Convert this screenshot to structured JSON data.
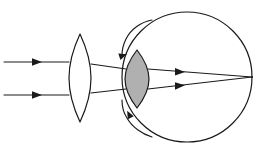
{
  "figure": {
    "type": "optical-ray-diagram",
    "canvas": {
      "width": 263,
      "height": 154,
      "background": "#ffffff"
    }
  },
  "colors": {
    "stroke": "#1a1a1a",
    "eye_lens_fill": "#b0b0b0",
    "background": "#ffffff",
    "shape_fill": "#ffffff"
  },
  "elements": {
    "corrective_lens": {
      "label": "corrective converging lens",
      "shape": "biconvex",
      "center_x": 80,
      "top_y": 34,
      "bottom_y": 122,
      "half_width": 11,
      "fill": "#ffffff"
    },
    "eyeball": {
      "label": "eyeball outline",
      "shape": "circle",
      "center_x": 187,
      "center_y": 77,
      "radius": 65,
      "fill": "#ffffff"
    },
    "cornea_arcs": {
      "label": "cornea arcs",
      "count": 2,
      "has_arrowheads": true
    },
    "eye_lens": {
      "label": "crystalline lens of the eye",
      "shape": "biconvex",
      "center_x": 137,
      "top_y": 50,
      "bottom_y": 108,
      "half_width": 12,
      "fill": "#b0b0b0"
    },
    "focal_point": {
      "label": "retina focal point",
      "x": 252,
      "y": 77
    }
  },
  "chart_data": {
    "type": "scatter",
    "xlabel": "",
    "ylabel": "",
    "xlim": [
      0,
      263
    ],
    "ylim": [
      0,
      154
    ],
    "grid": false,
    "legend": "none",
    "series": [
      {
        "name": "upper incoming parallel ray",
        "points": [
          [
            4,
            62
          ],
          [
            69,
            62
          ]
        ],
        "arrow_at": [
          38,
          62
        ],
        "arrow_direction": "right"
      },
      {
        "name": "lower incoming parallel ray",
        "points": [
          [
            4,
            95
          ],
          [
            69,
            95
          ]
        ],
        "arrow_at": [
          38,
          95
        ],
        "arrow_direction": "right"
      },
      {
        "name": "upper refracted ray after corrective lens",
        "points": [
          [
            91,
            64
          ],
          [
            126,
            69
          ]
        ],
        "arrow_at": null,
        "arrow_direction": "right"
      },
      {
        "name": "lower refracted ray after corrective lens",
        "points": [
          [
            91,
            93
          ],
          [
            126,
            89
          ]
        ],
        "arrow_at": null,
        "arrow_direction": "right"
      },
      {
        "name": "upper ray converging to retina",
        "points": [
          [
            148,
            69
          ],
          [
            252,
            77
          ]
        ],
        "arrow_at": [
          182,
          71.6
        ],
        "arrow_direction": "right"
      },
      {
        "name": "lower ray converging to retina",
        "points": [
          [
            148,
            89
          ],
          [
            252,
            77
          ]
        ],
        "arrow_at": [
          182,
          85
        ],
        "arrow_direction": "right"
      }
    ],
    "annotations": [
      {
        "text": "",
        "note": "upper cornea arc with arrowhead pointing up-right"
      },
      {
        "text": "",
        "note": "lower cornea arc with arrowhead pointing down-left"
      }
    ]
  }
}
